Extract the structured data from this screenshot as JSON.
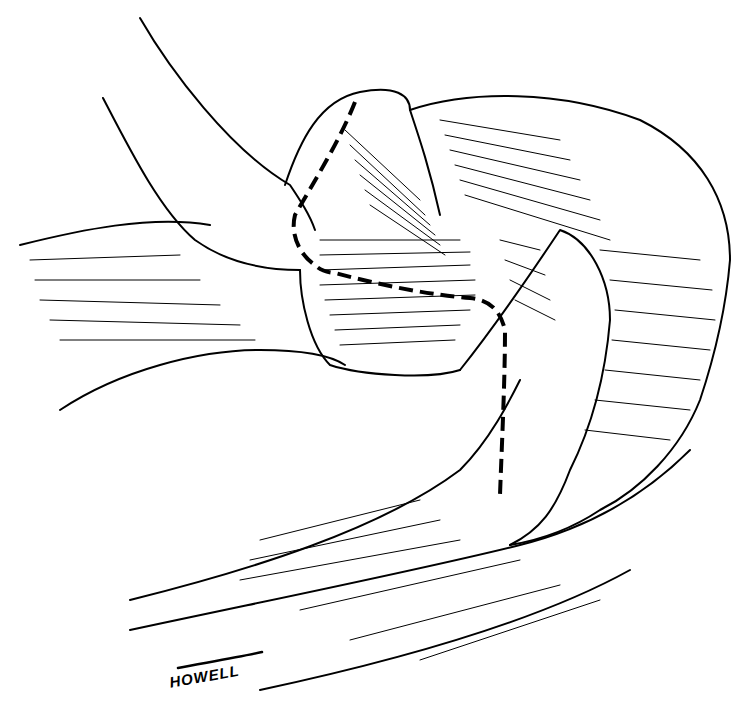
{
  "figure": {
    "type": "anatomical line illustration",
    "style": "black ink on white",
    "colors": {
      "ink": "#000000",
      "background": "#ffffff"
    },
    "signature": "HOWELL",
    "annotations": [
      {
        "kind": "dashed incision line",
        "description": "dashed line descending along tendon, turning across and then down"
      }
    ]
  }
}
